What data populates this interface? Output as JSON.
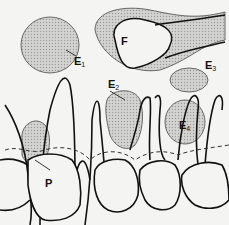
{
  "diagram": {
    "labels": [
      {
        "id": "E1",
        "text": "E",
        "sub": "1"
      },
      {
        "id": "F",
        "text": "F",
        "sub": ""
      },
      {
        "id": "E2",
        "text": "E",
        "sub": "2"
      },
      {
        "id": "E3",
        "text": "E",
        "sub": "3"
      },
      {
        "id": "E4",
        "text": "E",
        "sub": "4"
      },
      {
        "id": "P",
        "text": "P",
        "sub": ""
      }
    ],
    "colors": {
      "line": "#111111",
      "shade": "#c8c8c6",
      "background": "#f4f4f2"
    }
  }
}
